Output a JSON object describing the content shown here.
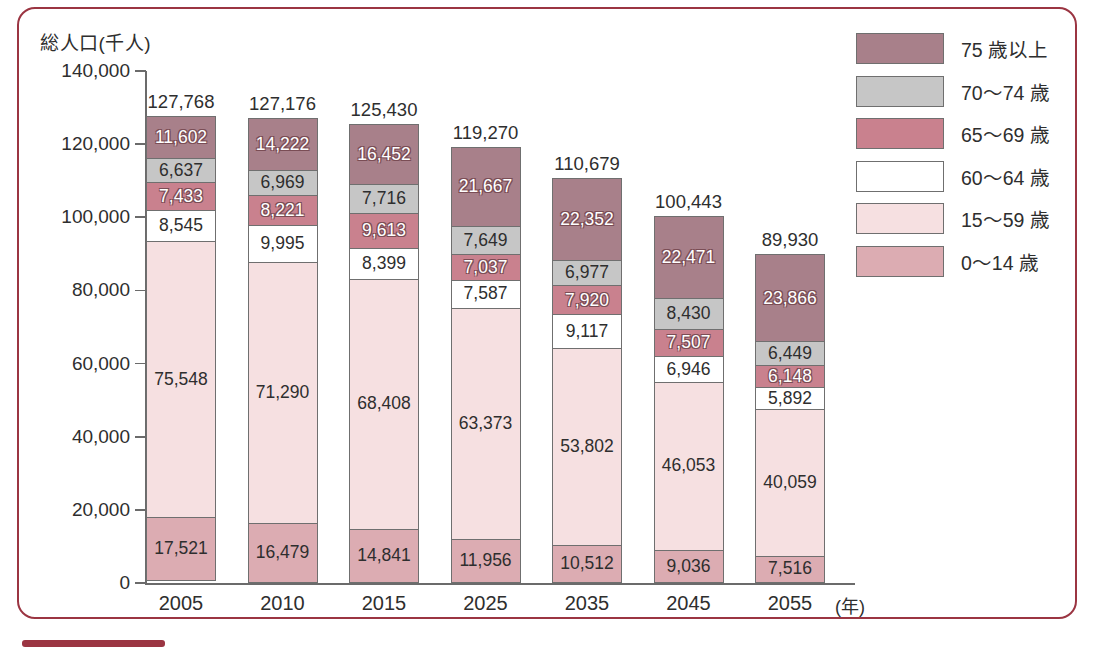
{
  "figure": {
    "axis_title": "総人口(千人)",
    "x_unit_label": "(年)",
    "frame_color": "#9b3542"
  },
  "legend": {
    "items": [
      {
        "label": "75 歳以上",
        "color": "#a8808a",
        "name": "legend-75-plus"
      },
      {
        "label": "70〜74 歳",
        "color": "#c6c6c6",
        "name": "legend-70-74"
      },
      {
        "label": "65〜69 歳",
        "color": "#c9818e",
        "name": "legend-65-69"
      },
      {
        "label": "60〜64 歳",
        "color": "#ffffff",
        "name": "legend-60-64"
      },
      {
        "label": "15〜59 歳",
        "color": "#f6e0e1",
        "name": "legend-15-59"
      },
      {
        "label": "0〜14 歳",
        "color": "#dcacb2",
        "name": "legend-0-14"
      }
    ]
  },
  "chart_data": {
    "type": "bar",
    "stacked": true,
    "title": "",
    "xlabel": "(年)",
    "ylabel": "総人口(千人)",
    "ylim": [
      0,
      140000
    ],
    "ytick_step": 20000,
    "ytick_labels": [
      "140,000",
      "120,000",
      "100,000",
      "80,000",
      "60,000",
      "40,000",
      "20,000",
      "0"
    ],
    "ytick_values": [
      140000,
      120000,
      100000,
      80000,
      60000,
      40000,
      20000,
      0
    ],
    "grid": false,
    "legend_position": "right",
    "categories": [
      "2005",
      "2010",
      "2015",
      "2025",
      "2035",
      "2045",
      "2055"
    ],
    "totals": [
      127768,
      127176,
      125430,
      119270,
      110679,
      100443,
      89930
    ],
    "total_labels": [
      "127,768",
      "127,176",
      "125,430",
      "119,270",
      "110,679",
      "100,443",
      "89,930"
    ],
    "series": [
      {
        "name": "75 歳以上",
        "color": "#a8808a",
        "text_style": "outline-white",
        "values": [
          11602,
          14222,
          16452,
          21667,
          22352,
          22471,
          23866
        ],
        "labels": [
          "11,602",
          "14,222",
          "16,452",
          "21,667",
          "22,352",
          "22,471",
          "23,866"
        ]
      },
      {
        "name": "70〜74 歳",
        "color": "#c6c6c6",
        "text_style": "dark",
        "values": [
          6637,
          6969,
          7716,
          7649,
          6977,
          8430,
          6449
        ],
        "labels": [
          "6,637",
          "6,969",
          "7,716",
          "7,649",
          "6,977",
          "8,430",
          "6,449"
        ]
      },
      {
        "name": "65〜69 歳",
        "color": "#c9818e",
        "text_style": "outline-white",
        "values": [
          7433,
          8221,
          9613,
          7037,
          7920,
          7507,
          6148
        ],
        "labels": [
          "7,433",
          "8,221",
          "9,613",
          "7,037",
          "7,920",
          "7,507",
          "6,148"
        ]
      },
      {
        "name": "60〜64 歳",
        "color": "#ffffff",
        "text_style": "dark",
        "values": [
          8545,
          9995,
          8399,
          7587,
          9117,
          6946,
          5892
        ],
        "labels": [
          "8,545",
          "9,995",
          "8,399",
          "7,587",
          "9,117",
          "6,946",
          "5,892"
        ]
      },
      {
        "name": "15〜59 歳",
        "color": "#f6e0e1",
        "text_style": "dark",
        "values": [
          75548,
          71290,
          68408,
          63373,
          53802,
          46053,
          40059
        ],
        "labels": [
          "75,548",
          "71,290",
          "68,408",
          "63,373",
          "53,802",
          "46,053",
          "40,059"
        ]
      },
      {
        "name": "0〜14 歳",
        "color": "#dcacb2",
        "text_style": "dark",
        "values": [
          17521,
          16479,
          14841,
          11956,
          10512,
          9036,
          7516
        ],
        "labels": [
          "17,521",
          "16,479",
          "14,841",
          "11,956",
          "10,512",
          "9,036",
          "7,516"
        ]
      }
    ]
  }
}
